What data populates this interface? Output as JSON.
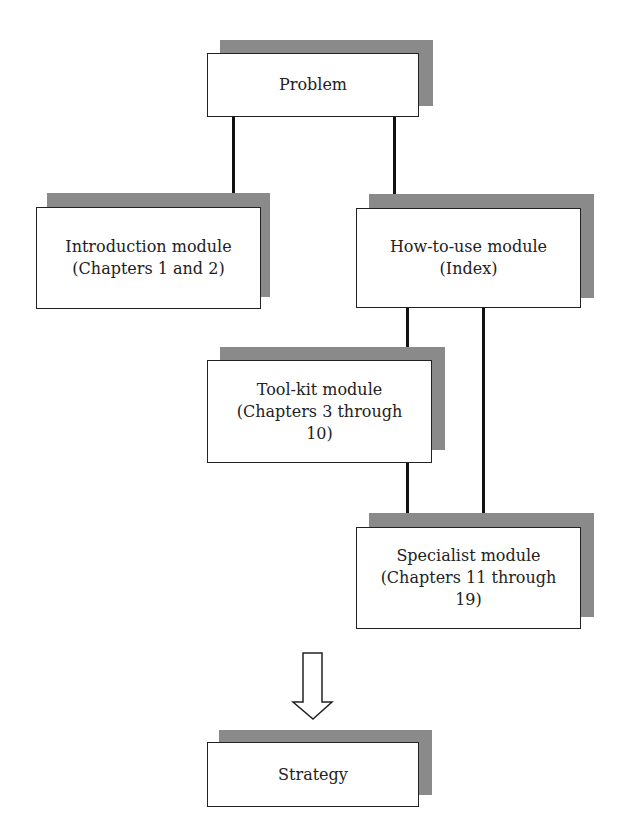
{
  "diagram": {
    "nodes": {
      "problem": "Problem",
      "introduction": "Introduction module\n(Chapters 1 and 2)",
      "how_to_use": "How-to-use module\n(Index)",
      "tool_kit": "Tool-kit module\n(Chapters 3 through\n10)",
      "specialist": "Specialist module\n(Chapters 11 through\n19)",
      "strategy": "Strategy"
    },
    "edges": [
      {
        "from": "problem",
        "to": "introduction"
      },
      {
        "from": "problem",
        "to": "how_to_use"
      },
      {
        "from": "how_to_use",
        "to": "tool_kit"
      },
      {
        "from": "how_to_use",
        "to": "specialist"
      },
      {
        "from": "tool_kit",
        "to": "specialist"
      },
      {
        "from": "specialist",
        "to": "strategy",
        "style": "hollow-arrow"
      }
    ],
    "colors": {
      "shadow": "#8a8a8a",
      "border": "#222222",
      "background": "#ffffff"
    }
  }
}
